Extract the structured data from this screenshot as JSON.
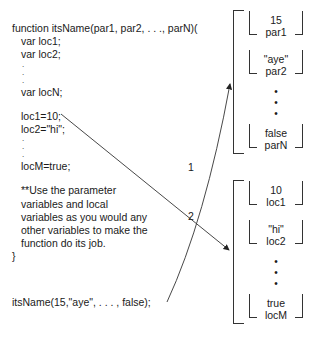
{
  "code": {
    "header": "function itsName(par1, par2, . . ., parN)(",
    "decl1": "var loc1;",
    "decl2": "var loc2;",
    "dot": ".",
    "declN": "var locN;",
    "assign1": "loc1=10;",
    "assign2": "loc2=\"hi\";",
    "assignM": "locM=true;",
    "note": [
      "**Use the parameter",
      "variables and local",
      "variables as you would any",
      "other variables to make the",
      "function do its job."
    ],
    "close": "}",
    "call": "itsName(15,\"aye\", . . . , false);"
  },
  "arrows": {
    "label1": "1",
    "label2": "2"
  },
  "params_frame": {
    "boxes": [
      {
        "value": "15",
        "name": "par1"
      },
      {
        "value": "\"aye\"",
        "name": "par2"
      },
      {
        "value": "false",
        "name": "parN"
      }
    ],
    "ellipsis": "•"
  },
  "locals_frame": {
    "boxes": [
      {
        "value": "10",
        "name": "loc1"
      },
      {
        "value": "\"hi\"",
        "name": "loc2"
      },
      {
        "value": "true",
        "name": "locM"
      }
    ],
    "ellipsis": "•"
  }
}
